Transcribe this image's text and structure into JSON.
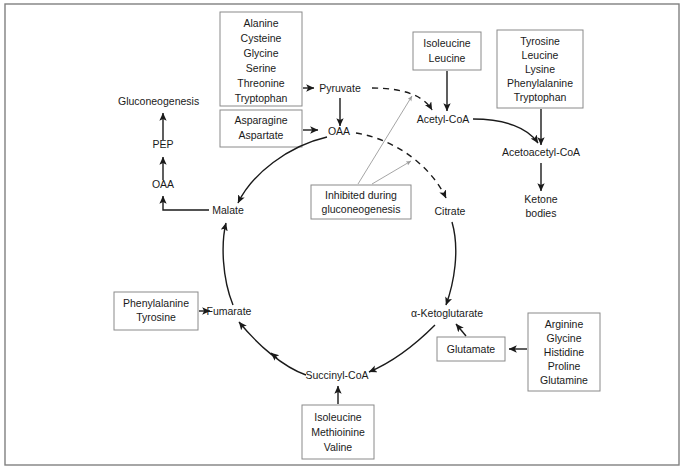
{
  "diagram": {
    "colors": {
      "background": "#ffffff",
      "text": "#1a1a1a",
      "box_border": "#8a8a8a",
      "arrow": "#1a1a1a",
      "pointer_line": "#9b9b9b",
      "frame": "#808080"
    }
  },
  "nodes": {
    "gluconeogenesis": "Gluconeogenesis",
    "pep": "PEP",
    "oaa_left": "OAA",
    "malate": "Malate",
    "oaa_cycle": "OAA",
    "pyruvate": "Pyruvate",
    "acetyl_coa": "Acetyl-CoA",
    "acetoacetyl_coa": "Acetoacetyl-CoA",
    "ketone_bodies_line1": "Ketone",
    "ketone_bodies_line2": "bodies",
    "citrate": "Citrate",
    "alpha_ketoglutarate": "α-Ketoglutarate",
    "succinyl_coa": "Succinyl-CoA",
    "fumarate": "Fumarate"
  },
  "boxes": {
    "pyruvate_precursors": {
      "name": "pyruvate-amino-acids",
      "lines": [
        "Alanine",
        "Cysteine",
        "Glycine",
        "Serine",
        "Threonine",
        "Tryptophan"
      ]
    },
    "oaa_precursors": {
      "name": "oaa-amino-acids",
      "lines": [
        "Asparagine",
        "Aspartate"
      ]
    },
    "acetyl_coa_precursors": {
      "name": "acetyl-coa-amino-acids",
      "lines": [
        "Isoleucine",
        "Leucine"
      ]
    },
    "acetoacetyl_coa_precursors": {
      "name": "acetoacetyl-coa-amino-acids",
      "lines": [
        "Tyrosine",
        "Leucine",
        "Lysine",
        "Phenylalanine",
        "Tryptophan"
      ]
    },
    "inhibited_note": {
      "name": "inhibited-note",
      "lines": [
        "Inhibited during",
        "gluconeogenesis"
      ]
    },
    "fumarate_precursors": {
      "name": "fumarate-amino-acids",
      "lines": [
        "Phenylalanine",
        "Tyrosine"
      ]
    },
    "succinyl_coa_precursors": {
      "name": "succinyl-coa-amino-acids",
      "lines": [
        "Isoleucine",
        "Methioinine",
        "Valine"
      ]
    },
    "glutamate": {
      "name": "glutamate-node",
      "lines": [
        "Glutamate"
      ]
    },
    "glutamate_precursors": {
      "name": "glutamate-amino-acids",
      "lines": [
        "Arginine",
        "Glycine",
        "Histidine",
        "Proline",
        "Glutamine"
      ]
    }
  }
}
